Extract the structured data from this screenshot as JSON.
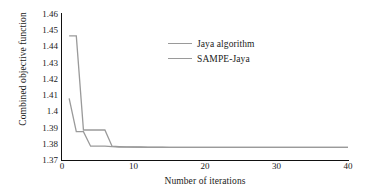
{
  "chart_data": {
    "type": "line",
    "title": "",
    "xlabel": "Number of iterations",
    "ylabel": "Combined objective function",
    "xlim": [
      0,
      40
    ],
    "ylim": [
      1.37,
      1.46
    ],
    "xticks": [
      0,
      10,
      20,
      30,
      40
    ],
    "yticks": [
      "1.37",
      "1.38",
      "1.39",
      "1.4",
      "1.41",
      "1.42",
      "1.43",
      "1.44",
      "1.45",
      "1.46"
    ],
    "grid": false,
    "legend_position": "upper-center-right",
    "series": [
      {
        "name": "Jaya algorithm",
        "color": "#9a9a9a",
        "x": [
          1,
          2,
          3,
          4,
          5,
          6,
          7,
          8,
          9,
          10,
          11,
          12,
          13,
          14,
          15,
          16,
          17,
          18,
          19,
          20,
          22,
          24,
          26,
          28,
          30,
          32,
          34,
          36,
          38,
          40
        ],
        "y": [
          1.4465,
          1.4465,
          1.3885,
          1.3885,
          1.3885,
          1.3885,
          1.3785,
          1.3783,
          1.3781,
          1.378,
          1.378,
          1.3779,
          1.3779,
          1.3779,
          1.3778,
          1.3778,
          1.3778,
          1.3778,
          1.3778,
          1.3778,
          1.3778,
          1.3778,
          1.3778,
          1.3778,
          1.3778,
          1.3778,
          1.3778,
          1.3778,
          1.3778,
          1.3778
        ]
      },
      {
        "name": "SAMPE-Jaya",
        "color": "#9a9a9a",
        "x": [
          1,
          2,
          3,
          4,
          5,
          6,
          7,
          8,
          9,
          10,
          12,
          14,
          16,
          18,
          20,
          24,
          28,
          32,
          36,
          40
        ],
        "y": [
          1.408,
          1.3875,
          1.3875,
          1.3785,
          1.3785,
          1.3785,
          1.3782,
          1.378,
          1.3779,
          1.3779,
          1.3778,
          1.3778,
          1.3778,
          1.3778,
          1.3778,
          1.3778,
          1.3778,
          1.3778,
          1.3778,
          1.3778
        ]
      }
    ]
  },
  "legend": {
    "items": [
      {
        "label": "Jaya algorithm"
      },
      {
        "label": "SAMPE-Jaya"
      }
    ]
  }
}
